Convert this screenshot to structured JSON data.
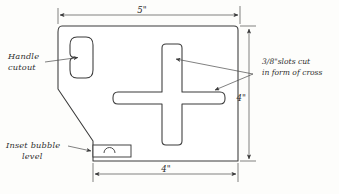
{
  "drawing": {
    "title": "Plate layout sketch",
    "background_color": "#fdfdfb",
    "line_color": "#3a3a3a",
    "annotations": {
      "handle_cutout": {
        "line1": "Handle",
        "line2": "cutout"
      },
      "slots_note": {
        "line1": "3/8\"slots cut",
        "line2": "in form of cross"
      },
      "bubble_level": {
        "line1": "Inset bubble",
        "line2": "level"
      }
    },
    "dimensions": {
      "top_width": "5\"",
      "right_height": "4\"",
      "bottom_width": "4\""
    }
  }
}
